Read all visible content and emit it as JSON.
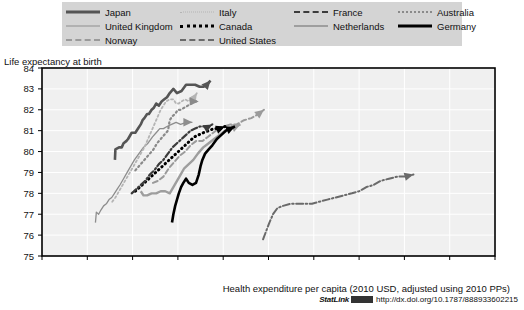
{
  "legend": {
    "columns": [
      {
        "items": [
          {
            "label": "Japan",
            "style": "ls-japan",
            "key": "japan"
          },
          {
            "label": "United Kingdom",
            "style": "ls-uk",
            "key": "uk"
          },
          {
            "label": "Norway",
            "style": "ls-norway",
            "key": "norway"
          }
        ]
      },
      {
        "items": [
          {
            "label": "Italy",
            "style": "ls-italy",
            "key": "italy"
          },
          {
            "label": "Canada",
            "style": "ls-canada",
            "key": "canada"
          },
          {
            "label": "United States",
            "style": "ls-us",
            "key": "us"
          }
        ]
      },
      {
        "items": [
          {
            "label": "France",
            "style": "ls-france",
            "key": "france"
          },
          {
            "label": "Netherlands",
            "style": "ls-netherlands",
            "key": "netherlands"
          }
        ]
      },
      {
        "items": [
          {
            "label": "Australia",
            "style": "ls-australia",
            "key": "australia"
          },
          {
            "label": "Germany",
            "style": "ls-germany",
            "key": "germany"
          }
        ]
      }
    ]
  },
  "footer": {
    "statlink_word": "StatLink",
    "statlink_url": "http://dx.doi.org/10.1787/888933602215"
  },
  "chart_data": {
    "type": "line",
    "title": "Life expectancy at birth",
    "ylabel": "Life expectancy at birth",
    "xlabel": "Health expenditure per capita (2010 USD, adjusted using 2010 PPs)",
    "xlim": [
      0,
      10000
    ],
    "ylim": [
      75,
      84
    ],
    "xticks": [
      0,
      1000,
      2000,
      3000,
      4000,
      5000,
      6000,
      7000,
      8000,
      9000,
      10000
    ],
    "xtick_labels": [
      "0",
      "1000",
      "2000",
      "3000",
      "4000",
      "5000",
      "6000",
      "7000",
      "8000",
      "9000",
      "10 000"
    ],
    "yticks": [
      75,
      76,
      77,
      78,
      79,
      80,
      81,
      82,
      83,
      84
    ],
    "ytick_labels": [
      "75",
      "76",
      "77",
      "78",
      "79",
      "80",
      "81",
      "82",
      "83",
      "84"
    ],
    "grid": true,
    "legend_position": "top",
    "arrow_marks": true,
    "colors": {
      "japan": "#555555",
      "uk": "#8d8d8d",
      "norway": "#9a9a9a",
      "italy": "#b4b4b4",
      "canada": "#000000",
      "us": "#6a6a6a",
      "france": "#3c3c3c",
      "netherlands": "#9e9e9e",
      "australia": "#8a8a8a",
      "germany": "#000000",
      "plot_background": "#f0f0f0",
      "legend_background": "#d4d4d4",
      "grid_line": "#ffffff",
      "axis": "#000000"
    },
    "series": [
      {
        "name": "Japan",
        "key": "japan",
        "color": "#555555",
        "dash": "none",
        "width": 2.6,
        "points": [
          [
            1610,
            79.6
          ],
          [
            1620,
            80.1
          ],
          [
            1700,
            80.2
          ],
          [
            1760,
            80.2
          ],
          [
            1800,
            80.4
          ],
          [
            1860,
            80.5
          ],
          [
            1900,
            80.6
          ],
          [
            1980,
            80.9
          ],
          [
            2060,
            80.9
          ],
          [
            2120,
            81.1
          ],
          [
            2180,
            81.3
          ],
          [
            2220,
            81.5
          ],
          [
            2260,
            81.6
          ],
          [
            2320,
            81.8
          ],
          [
            2360,
            81.8
          ],
          [
            2420,
            82.0
          ],
          [
            2470,
            82.1
          ],
          [
            2520,
            82.3
          ],
          [
            2580,
            82.2
          ],
          [
            2640,
            82.4
          ],
          [
            2700,
            82.5
          ],
          [
            2760,
            82.6
          ],
          [
            2820,
            82.8
          ],
          [
            2900,
            83.0
          ],
          [
            2980,
            82.8
          ],
          [
            3080,
            82.9
          ],
          [
            3180,
            83.2
          ],
          [
            3280,
            83.2
          ],
          [
            3380,
            83.2
          ],
          [
            3480,
            83.1
          ],
          [
            3560,
            83.1
          ],
          [
            3640,
            83.2
          ],
          [
            3720,
            83.4
          ]
        ]
      },
      {
        "name": "United Kingdom",
        "key": "uk",
        "color": "#8d8d8d",
        "dash": "none",
        "width": 1.3,
        "points": [
          [
            1180,
            76.6
          ],
          [
            1200,
            77.1
          ],
          [
            1250,
            77.0
          ],
          [
            1300,
            77.2
          ],
          [
            1360,
            77.4
          ],
          [
            1420,
            77.5
          ],
          [
            1480,
            77.7
          ],
          [
            1540,
            77.8
          ],
          [
            1600,
            78.0
          ],
          [
            1660,
            78.2
          ],
          [
            1720,
            78.4
          ],
          [
            1800,
            78.7
          ],
          [
            1880,
            79.0
          ],
          [
            1960,
            79.3
          ],
          [
            2040,
            79.6
          ],
          [
            2140,
            79.9
          ],
          [
            2240,
            80.2
          ],
          [
            2340,
            80.4
          ],
          [
            2440,
            80.7
          ],
          [
            2520,
            80.9
          ],
          [
            2600,
            81.1
          ],
          [
            2680,
            81.1
          ],
          [
            2760,
            81.2
          ],
          [
            2860,
            81.3
          ],
          [
            2960,
            81.4
          ],
          [
            3060,
            81.3
          ],
          [
            3180,
            81.4
          ],
          [
            3320,
            81.4
          ]
        ]
      },
      {
        "name": "Norway",
        "key": "norway",
        "color": "#9a9a9a",
        "dash": "5,3",
        "width": 2.0,
        "points": [
          [
            2450,
            78.5
          ],
          [
            2560,
            78.6
          ],
          [
            2680,
            78.8
          ],
          [
            2800,
            79.2
          ],
          [
            2920,
            79.5
          ],
          [
            3040,
            79.8
          ],
          [
            3160,
            80.0
          ],
          [
            3280,
            80.3
          ],
          [
            3400,
            80.5
          ],
          [
            3540,
            80.5
          ],
          [
            3660,
            80.7
          ],
          [
            3780,
            80.9
          ],
          [
            3900,
            81.1
          ],
          [
            4020,
            81.2
          ],
          [
            4160,
            81.3
          ],
          [
            4300,
            81.3
          ],
          [
            4460,
            81.5
          ],
          [
            4620,
            81.6
          ],
          [
            4780,
            81.8
          ],
          [
            4900,
            82.0
          ]
        ]
      },
      {
        "name": "Italy",
        "key": "italy",
        "color": "#b4b4b4",
        "dash": "2,2.6",
        "width": 1.8,
        "points": [
          [
            1550,
            77.6
          ],
          [
            1620,
            77.8
          ],
          [
            1700,
            78.1
          ],
          [
            1780,
            78.4
          ],
          [
            1860,
            78.7
          ],
          [
            1940,
            79.0
          ],
          [
            2020,
            79.3
          ],
          [
            2100,
            79.6
          ],
          [
            2180,
            79.9
          ],
          [
            2260,
            80.2
          ],
          [
            2320,
            80.5
          ],
          [
            2380,
            80.8
          ],
          [
            2440,
            81.1
          ],
          [
            2500,
            81.4
          ],
          [
            2560,
            81.7
          ],
          [
            2620,
            82.0
          ],
          [
            2680,
            82.2
          ],
          [
            2740,
            82.4
          ],
          [
            2820,
            82.5
          ],
          [
            2900,
            82.5
          ],
          [
            2960,
            82.3
          ],
          [
            3020,
            82.3
          ],
          [
            3080,
            82.4
          ],
          [
            3160,
            82.5
          ],
          [
            3240,
            82.4
          ],
          [
            3300,
            82.6
          ],
          [
            3360,
            82.6
          ],
          [
            3420,
            82.8
          ]
        ]
      },
      {
        "name": "Canada",
        "key": "canada",
        "color": "#000000",
        "dash": "0.5,4",
        "width": 3.0,
        "points": [
          [
            2060,
            78.1
          ],
          [
            2160,
            78.3
          ],
          [
            2260,
            78.5
          ],
          [
            2360,
            78.7
          ],
          [
            2460,
            78.9
          ],
          [
            2560,
            79.1
          ],
          [
            2660,
            79.3
          ],
          [
            2760,
            79.5
          ],
          [
            2860,
            79.7
          ],
          [
            2960,
            79.9
          ],
          [
            3060,
            80.1
          ],
          [
            3160,
            80.3
          ],
          [
            3260,
            80.5
          ],
          [
            3360,
            80.7
          ],
          [
            3460,
            80.8
          ],
          [
            3560,
            80.9
          ],
          [
            3680,
            81.0
          ],
          [
            3800,
            81.1
          ],
          [
            3920,
            81.1
          ],
          [
            4040,
            81.2
          ]
        ]
      },
      {
        "name": "United States",
        "key": "us",
        "color": "#6a6a6a",
        "dash": "7,2.5,1.5,2.5",
        "width": 2.0,
        "points": [
          [
            4880,
            75.8
          ],
          [
            4950,
            76.2
          ],
          [
            5020,
            76.6
          ],
          [
            5100,
            77.0
          ],
          [
            5200,
            77.3
          ],
          [
            5320,
            77.4
          ],
          [
            5480,
            77.5
          ],
          [
            5640,
            77.5
          ],
          [
            5800,
            77.5
          ],
          [
            5960,
            77.5
          ],
          [
            6120,
            77.6
          ],
          [
            6300,
            77.7
          ],
          [
            6480,
            77.8
          ],
          [
            6660,
            77.9
          ],
          [
            6840,
            78.0
          ],
          [
            7000,
            78.1
          ],
          [
            7160,
            78.3
          ],
          [
            7320,
            78.4
          ],
          [
            7480,
            78.6
          ],
          [
            7660,
            78.7
          ],
          [
            7840,
            78.8
          ],
          [
            8020,
            78.8
          ],
          [
            8200,
            78.9
          ]
        ]
      },
      {
        "name": "France",
        "key": "france",
        "color": "#3c3c3c",
        "dash": "6,2.5,1.5,2.5",
        "width": 2.2,
        "points": [
          [
            1980,
            78.0
          ],
          [
            2080,
            78.2
          ],
          [
            2180,
            78.4
          ],
          [
            2280,
            78.6
          ],
          [
            2380,
            78.9
          ],
          [
            2480,
            79.1
          ],
          [
            2580,
            79.4
          ],
          [
            2680,
            79.6
          ],
          [
            2780,
            79.9
          ],
          [
            2880,
            80.2
          ],
          [
            2980,
            80.4
          ],
          [
            3080,
            80.6
          ],
          [
            3180,
            80.8
          ],
          [
            3280,
            81.0
          ],
          [
            3380,
            81.1
          ],
          [
            3480,
            81.2
          ],
          [
            3580,
            81.2
          ],
          [
            3680,
            81.2
          ],
          [
            3760,
            81.3
          ]
        ]
      },
      {
        "name": "Netherlands",
        "key": "netherlands",
        "color": "#9e9e9e",
        "dash": "none",
        "width": 2.4,
        "points": [
          [
            2180,
            78.1
          ],
          [
            2240,
            77.9
          ],
          [
            2320,
            77.9
          ],
          [
            2420,
            78.0
          ],
          [
            2520,
            78.0
          ],
          [
            2620,
            78.1
          ],
          [
            2720,
            78.1
          ],
          [
            2820,
            78.0
          ],
          [
            2900,
            78.3
          ],
          [
            2980,
            78.6
          ],
          [
            3060,
            78.9
          ],
          [
            3140,
            79.2
          ],
          [
            3240,
            79.4
          ],
          [
            3340,
            79.6
          ],
          [
            3440,
            79.9
          ],
          [
            3560,
            80.2
          ],
          [
            3680,
            80.4
          ],
          [
            3800,
            80.6
          ],
          [
            3920,
            80.8
          ],
          [
            4040,
            81.0
          ],
          [
            4160,
            81.1
          ],
          [
            4280,
            81.2
          ],
          [
            4380,
            81.3
          ]
        ]
      },
      {
        "name": "Australia",
        "key": "australia",
        "color": "#8a8a8a",
        "dash": "1.5,3",
        "width": 2.2,
        "points": [
          [
            2060,
            79.1
          ],
          [
            2140,
            79.3
          ],
          [
            2220,
            79.5
          ],
          [
            2300,
            79.7
          ],
          [
            2380,
            79.9
          ],
          [
            2460,
            80.1
          ],
          [
            2540,
            80.4
          ],
          [
            2620,
            80.6
          ],
          [
            2700,
            80.8
          ],
          [
            2780,
            81.0
          ],
          [
            2820,
            81.5
          ],
          [
            2880,
            81.7
          ],
          [
            2940,
            81.8
          ],
          [
            3000,
            82.0
          ],
          [
            3060,
            82.0
          ],
          [
            3140,
            82.1
          ],
          [
            3220,
            82.2
          ],
          [
            3300,
            82.3
          ],
          [
            3380,
            82.4
          ],
          [
            3460,
            82.4
          ]
        ]
      },
      {
        "name": "Germany",
        "key": "germany",
        "color": "#000000",
        "dash": "none",
        "width": 2.6,
        "points": [
          [
            2870,
            76.6
          ],
          [
            2900,
            77.0
          ],
          [
            2940,
            77.4
          ],
          [
            2980,
            77.7
          ],
          [
            3020,
            78.0
          ],
          [
            3070,
            78.3
          ],
          [
            3120,
            78.5
          ],
          [
            3180,
            78.7
          ],
          [
            3240,
            78.5
          ],
          [
            3320,
            78.4
          ],
          [
            3400,
            78.5
          ],
          [
            3460,
            78.9
          ],
          [
            3500,
            79.3
          ],
          [
            3540,
            79.6
          ],
          [
            3600,
            79.9
          ],
          [
            3680,
            80.1
          ],
          [
            3760,
            80.3
          ],
          [
            3860,
            80.6
          ],
          [
            3960,
            80.8
          ],
          [
            4060,
            81.0
          ],
          [
            4160,
            81.1
          ],
          [
            4260,
            81.2
          ]
        ]
      }
    ]
  }
}
